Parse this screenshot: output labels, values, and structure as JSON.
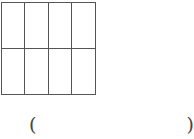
{
  "figure": {
    "grid": {
      "columns": 4,
      "rows": 2,
      "shaded_cells": [],
      "line_color": "#555555"
    }
  },
  "answer": {
    "open_paren": "(",
    "value": "",
    "close_paren": ")"
  }
}
